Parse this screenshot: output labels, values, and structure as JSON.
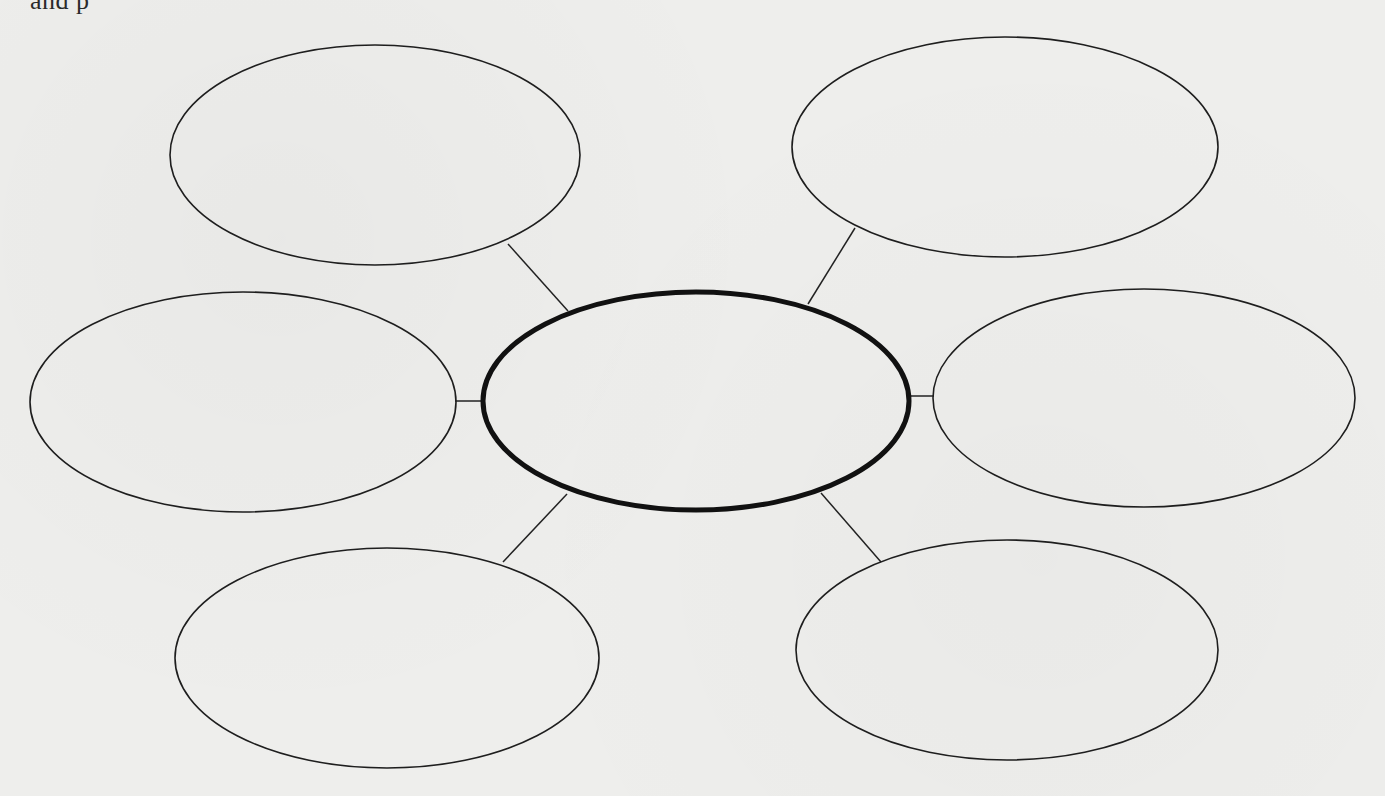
{
  "document": {
    "type": "graphic organizer (concept web)",
    "cutoff_top_text": "and          p",
    "paper_color": "#eeeeec",
    "line_color": "#1e1e1e"
  },
  "diagram": {
    "center": {
      "id": "center",
      "label": "",
      "cx": 696,
      "cy": 401,
      "rx": 213,
      "ry": 109,
      "stroke_width": 5
    },
    "nodes": [
      {
        "id": "top-left",
        "label": "",
        "cx": 375,
        "cy": 155,
        "rx": 205,
        "ry": 110
      },
      {
        "id": "top-right",
        "label": "",
        "cx": 1005,
        "cy": 147,
        "rx": 213,
        "ry": 110
      },
      {
        "id": "middle-left",
        "label": "",
        "cx": 243,
        "cy": 402,
        "rx": 213,
        "ry": 110
      },
      {
        "id": "middle-right",
        "label": "",
        "cx": 1144,
        "cy": 398,
        "rx": 211,
        "ry": 109
      },
      {
        "id": "bottom-left",
        "label": "",
        "cx": 387,
        "cy": 658,
        "rx": 212,
        "ry": 110
      },
      {
        "id": "bottom-right",
        "label": "",
        "cx": 1007,
        "cy": 650,
        "rx": 211,
        "ry": 110
      }
    ],
    "connectors": [
      {
        "from": "top-left",
        "to": "center",
        "x1": 508,
        "y1": 244,
        "x2": 568,
        "y2": 311
      },
      {
        "from": "top-right",
        "to": "center",
        "x1": 855,
        "y1": 228,
        "x2": 808,
        "y2": 304
      },
      {
        "from": "middle-left",
        "to": "center",
        "x1": 455,
        "y1": 401,
        "x2": 483,
        "y2": 401
      },
      {
        "from": "middle-right",
        "to": "center",
        "x1": 910,
        "y1": 396,
        "x2": 934,
        "y2": 396
      },
      {
        "from": "bottom-left",
        "to": "center",
        "x1": 503,
        "y1": 562,
        "x2": 567,
        "y2": 494
      },
      {
        "from": "bottom-right",
        "to": "center",
        "x1": 881,
        "y1": 562,
        "x2": 821,
        "y2": 493
      }
    ]
  }
}
